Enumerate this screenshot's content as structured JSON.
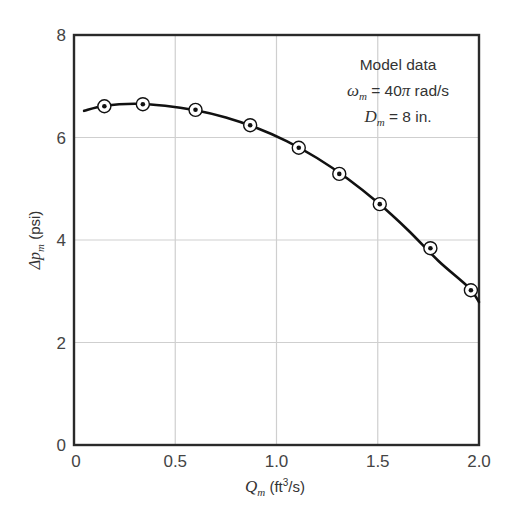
{
  "chart_data": {
    "type": "line",
    "title": "",
    "xlabel": "Q_m (ft^3/s)",
    "ylabel": "Δp_m (psi)",
    "xlim": [
      0,
      2.0
    ],
    "ylim": [
      0,
      8
    ],
    "grid": true,
    "x_ticks": [
      "0",
      "0.5",
      "1.0",
      "1.5",
      "2.0"
    ],
    "y_ticks": [
      "0",
      "2",
      "4",
      "6",
      "8"
    ],
    "series": [
      {
        "name": "Model data (measured points)",
        "marker": "circled-dot",
        "x": [
          0.15,
          0.34,
          0.6,
          0.87,
          1.11,
          1.31,
          1.51,
          1.76,
          1.96
        ],
        "y": [
          6.61,
          6.65,
          6.54,
          6.24,
          5.8,
          5.29,
          4.7,
          3.84,
          3.02
        ]
      },
      {
        "name": "Fitted curve",
        "marker": "none",
        "x": [
          0.05,
          0.15,
          0.3,
          0.45,
          0.6,
          0.75,
          0.9,
          1.05,
          1.2,
          1.35,
          1.5,
          1.65,
          1.8,
          1.95,
          2.0
        ],
        "y": [
          6.52,
          6.62,
          6.66,
          6.62,
          6.53,
          6.39,
          6.19,
          5.93,
          5.6,
          5.2,
          4.73,
          4.19,
          3.59,
          3.07,
          2.79
        ]
      }
    ],
    "annotations": [
      "Model data",
      "ω_m = 40π rad/s",
      "D_m = 8 in."
    ],
    "legend": "none"
  },
  "labels": {
    "annotation_line1": "Model data",
    "omega_symbol": "ω",
    "omega_sub": "m",
    "omega_rest": " = 40",
    "pi_symbol": "π",
    "omega_unit": " rad/s",
    "d_symbol": "D",
    "d_sub": "m",
    "d_rest": " = 8 in.",
    "x_symbol": "Q",
    "x_sub": "m",
    "x_unit_pre": " (ft",
    "x_unit_sup": "3",
    "x_unit_post": "/s)",
    "y_symbol": "Δp",
    "y_sub": "m",
    "y_unit": " (psi)"
  },
  "colors": {
    "axis": "#2a2a2a",
    "grid": "#cfcfcf",
    "curve": "#111111",
    "text": "#444444"
  }
}
